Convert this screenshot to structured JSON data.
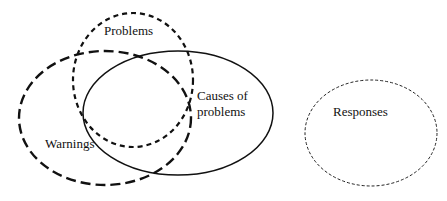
{
  "diagram": {
    "type": "venn",
    "sets": [
      {
        "id": "problems",
        "label": "Problems",
        "stroke": "medium-dashed"
      },
      {
        "id": "warnings",
        "label": "Warnings",
        "stroke": "long-dashed"
      },
      {
        "id": "causes",
        "label_line1": "Causes of",
        "label_line2": "problems",
        "stroke": "solid"
      },
      {
        "id": "responses",
        "label": "Responses",
        "stroke": "fine-dashed"
      }
    ],
    "colors": {
      "stroke": "#111111",
      "background": "#ffffff"
    }
  }
}
